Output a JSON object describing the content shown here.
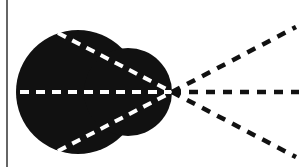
{
  "diagram": {
    "colors": {
      "background": "#ffffff",
      "shape": "#111111",
      "inner_dash": "#ffffff",
      "outer_dash": "#111111",
      "border_line": "#333333"
    },
    "border_line": {
      "x": 7,
      "y1": 0,
      "y2": 167
    },
    "shape": {
      "main_circle": {
        "cx": 78,
        "cy": 92,
        "r": 62
      },
      "bulge_circle": {
        "cx": 128,
        "cy": 92,
        "r": 44
      }
    },
    "focal_point": {
      "x": 172,
      "y": 92
    },
    "inner_lines": [
      {
        "x1": 58,
        "y1": 33,
        "x2": 172,
        "y2": 92
      },
      {
        "x1": 20,
        "y1": 92,
        "x2": 172,
        "y2": 92
      },
      {
        "x1": 58,
        "y1": 151,
        "x2": 172,
        "y2": 92
      }
    ],
    "outer_lines": [
      {
        "x1": 172,
        "y1": 92,
        "x2": 296,
        "y2": 27
      },
      {
        "x1": 172,
        "y1": 92,
        "x2": 299,
        "y2": 92
      },
      {
        "x1": 172,
        "y1": 92,
        "x2": 296,
        "y2": 157
      }
    ]
  }
}
